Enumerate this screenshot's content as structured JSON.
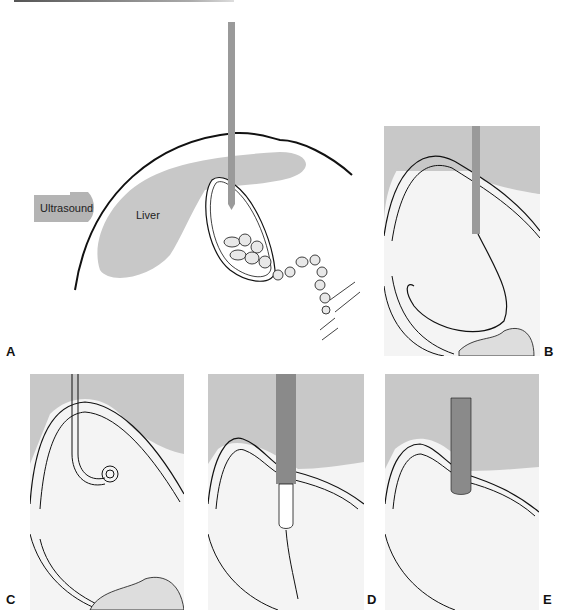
{
  "figure": {
    "panels": [
      {
        "id": "A",
        "label": "A",
        "annotations": {
          "probe": "Ultrasound",
          "organ": "Liver"
        }
      },
      {
        "id": "B",
        "label": "B"
      },
      {
        "id": "C",
        "label": "C"
      },
      {
        "id": "D",
        "label": "D"
      },
      {
        "id": "E",
        "label": "E"
      }
    ]
  },
  "colors": {
    "organ_gray": "#c8c8c8",
    "needle_gray": "#9a9a9a",
    "catheter_dark": "#8a8a8a",
    "line": "#111111"
  }
}
